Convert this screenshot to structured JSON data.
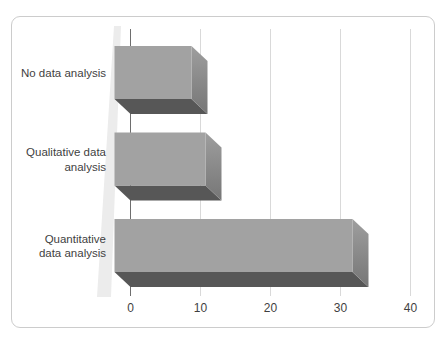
{
  "chart_data": {
    "type": "bar",
    "orientation": "horizontal",
    "style": "3d-box-bars",
    "title": "",
    "xlabel": "",
    "ylabel": "",
    "categories": [
      "No data analysis",
      "Qualitative data\nanalysis",
      "Quantitative\ndata analysis"
    ],
    "values": [
      11,
      13,
      34
    ],
    "x_ticks": [
      0,
      10,
      20,
      30,
      40
    ],
    "xlim": [
      0,
      40
    ],
    "grid": true,
    "legend": false,
    "colors": {
      "bar_front": "#a2a2a2",
      "bar_end_top": "#9e9e9e",
      "bar_end_bottom": "#767676",
      "bar_bottom": "#575757",
      "gridline": "#d9d9d9",
      "axis_line": "#6e6e6e",
      "wall_wedge": "#ececec",
      "text": "#3f3f3f",
      "frame_border": "#cccccc"
    }
  }
}
